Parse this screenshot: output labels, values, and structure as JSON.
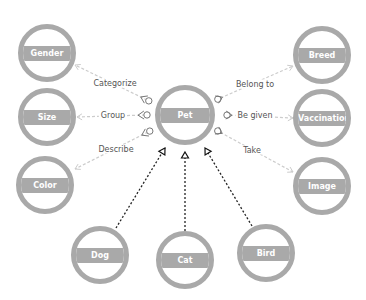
{
  "diagram": {
    "type": "entity-relationship",
    "colors": {
      "node_stroke": "#a9a9a9",
      "node_band": "#a9a9a9",
      "node_label": "#ffffff",
      "relation_line": "#cccccc",
      "inheritance_line": "#222222",
      "edge_label": "#555555"
    },
    "nodes": [
      {
        "id": "gender",
        "label": "Gender",
        "cx": 47,
        "cy": 53,
        "r": 29
      },
      {
        "id": "size",
        "label": "Size",
        "cx": 47,
        "cy": 117,
        "r": 29
      },
      {
        "id": "color",
        "label": "Color",
        "cx": 45,
        "cy": 185,
        "r": 29
      },
      {
        "id": "pet",
        "label": "Pet",
        "cx": 185,
        "cy": 115,
        "r": 30
      },
      {
        "id": "breed",
        "label": "Breed",
        "cx": 322,
        "cy": 55,
        "r": 29
      },
      {
        "id": "vaccination",
        "label": "Vaccination",
        "cx": 322,
        "cy": 118,
        "r": 29
      },
      {
        "id": "image",
        "label": "Image",
        "cx": 322,
        "cy": 186,
        "r": 29
      },
      {
        "id": "dog",
        "label": "Dog",
        "cx": 100,
        "cy": 255,
        "r": 29
      },
      {
        "id": "cat",
        "label": "Cat",
        "cx": 185,
        "cy": 260,
        "r": 29
      },
      {
        "id": "bird",
        "label": "Bird",
        "cx": 266,
        "cy": 253,
        "r": 29
      }
    ],
    "edges": [
      {
        "from": "pet",
        "to": "gender",
        "label": "Categorize",
        "label_x": 115,
        "label_y": 83,
        "style": "relation",
        "x1": 147,
        "y1": 100,
        "x2": 75,
        "y2": 65
      },
      {
        "from": "pet",
        "to": "size",
        "label": "Group",
        "label_x": 113,
        "label_y": 115,
        "style": "relation",
        "x1": 145,
        "y1": 115,
        "x2": 77,
        "y2": 117
      },
      {
        "from": "pet",
        "to": "color",
        "label": "Describe",
        "label_x": 116,
        "label_y": 149,
        "style": "relation",
        "x1": 148,
        "y1": 132,
        "x2": 75,
        "y2": 169
      },
      {
        "from": "pet",
        "to": "breed",
        "label": "Belong to",
        "label_x": 255,
        "label_y": 84,
        "style": "relation",
        "x1": 216,
        "y1": 100,
        "x2": 293,
        "y2": 66
      },
      {
        "from": "pet",
        "to": "vaccination",
        "label": "Be given",
        "label_x": 255,
        "label_y": 115,
        "style": "relation",
        "x1": 225,
        "y1": 115,
        "x2": 293,
        "y2": 118
      },
      {
        "from": "pet",
        "to": "image",
        "label": "Take",
        "label_x": 252,
        "label_y": 150,
        "style": "relation",
        "x1": 216,
        "y1": 130,
        "x2": 293,
        "y2": 172
      },
      {
        "from": "dog",
        "to": "pet",
        "label": "",
        "style": "inheritance",
        "x1": 116,
        "y1": 228,
        "x2": 165,
        "y2": 148
      },
      {
        "from": "cat",
        "to": "pet",
        "label": "",
        "style": "inheritance",
        "x1": 185,
        "y1": 231,
        "x2": 185,
        "y2": 152
      },
      {
        "from": "bird",
        "to": "pet",
        "label": "",
        "style": "inheritance",
        "x1": 252,
        "y1": 226,
        "x2": 205,
        "y2": 148
      }
    ]
  }
}
